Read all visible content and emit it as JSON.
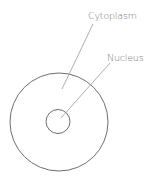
{
  "diagram": {
    "title": "",
    "labels": {
      "cytoplasm": "Cytoplasm",
      "nucleus": "Nucleus"
    },
    "colors": {
      "stroke": "#6e6e6e",
      "leader": "#9a9a9a",
      "text": "#7a7a7a",
      "background": "#ffffff"
    }
  }
}
